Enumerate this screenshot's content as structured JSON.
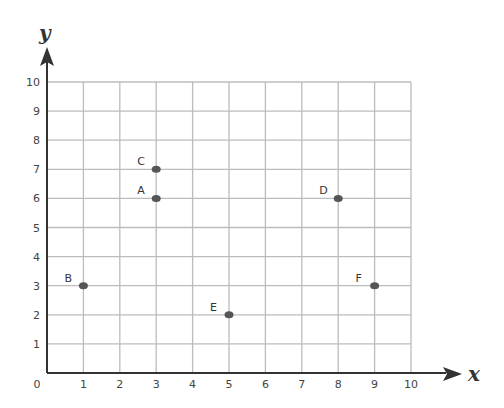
{
  "chart_data": {
    "type": "scatter",
    "title": "",
    "xlabel": "x",
    "ylabel": "y",
    "xlim": [
      0,
      10
    ],
    "ylim": [
      0,
      10
    ],
    "grid": true,
    "x_ticks": [
      "0",
      "1",
      "2",
      "3",
      "4",
      "5",
      "6",
      "7",
      "8",
      "9",
      "10"
    ],
    "y_ticks": [
      "1",
      "2",
      "3",
      "4",
      "5",
      "6",
      "7",
      "8",
      "9",
      "10"
    ],
    "points": [
      {
        "label": "A",
        "x": 3,
        "y": 6
      },
      {
        "label": "B",
        "x": 1,
        "y": 3
      },
      {
        "label": "C",
        "x": 3,
        "y": 7
      },
      {
        "label": "D",
        "x": 8,
        "y": 6
      },
      {
        "label": "E",
        "x": 5,
        "y": 2
      },
      {
        "label": "F",
        "x": 9,
        "y": 3
      }
    ]
  },
  "colors": {
    "axis": "#333333",
    "grid": "#bcbcbc",
    "point": "#555555"
  }
}
